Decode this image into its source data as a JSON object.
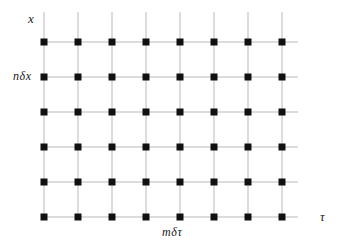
{
  "figure": {
    "type": "lattice-grid-diagram",
    "background_color": "#ffffff",
    "grid_line_color": "#b9b9b9",
    "node_color": "#111111",
    "label_color": "#1a1a1a"
  },
  "labels": {
    "vertical_axis": "x",
    "vertical_spacing": "nδx",
    "horizontal_spacing": "mδτ",
    "horizontal_axis": "τ"
  },
  "grid": {
    "columns": 8,
    "rows": 6,
    "column_x": [
      44,
      78,
      112,
      146,
      180,
      214,
      248,
      282
    ],
    "row_y": [
      42,
      77,
      112,
      147,
      182,
      217
    ],
    "node_size_px": 7,
    "line_width_px": 1,
    "vertical_line_top_y": 12,
    "vertical_line_bottom_y": 217,
    "horizontal_line_left_x": 44,
    "horizontal_line_right_x": 298
  },
  "chart_data": {
    "type": "scatter",
    "title": "",
    "xlabel": "τ",
    "ylabel": "x",
    "annotations": [
      "nδx",
      "mδτ"
    ],
    "x": [
      44,
      78,
      112,
      146,
      180,
      214,
      248,
      282
    ],
    "y": [
      42,
      77,
      112,
      147,
      182,
      217
    ],
    "grid": true,
    "legend": "none"
  }
}
